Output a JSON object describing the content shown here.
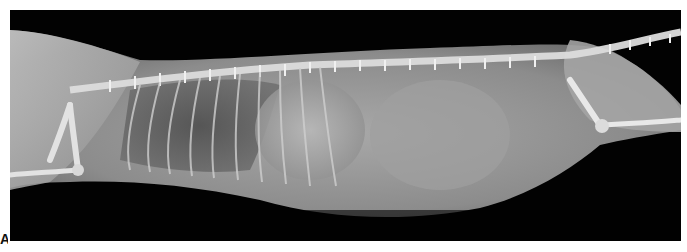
{
  "figure": {
    "type": "radiograph",
    "view": "lateral",
    "panel_label": "A",
    "colors": {
      "background": "#ffffff",
      "film": "#020202",
      "soft_tissue": "#9a9a9a",
      "bone": "#e6e6e6",
      "lung": "#5a5a5a"
    }
  }
}
